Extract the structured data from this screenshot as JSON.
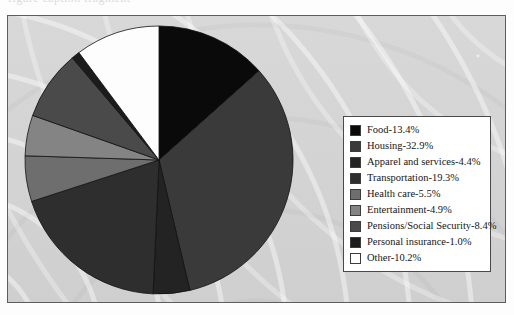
{
  "scan": {
    "top_cropped_text": "figure caption fragment",
    "panel_bg_color": "#d6d6d6",
    "panel_border_color": "#5d5d5d",
    "page_bg_color": "#fdfdfd"
  },
  "legend": {
    "background_color": "#ffffff",
    "border_color": "#4a4a4a",
    "items": [
      {
        "label": "Food-13.4%",
        "color": "#0a0a0a"
      },
      {
        "label": "Housing-32.9%",
        "color": "#3a3a3a"
      },
      {
        "label": "Apparel and services-4.4%",
        "color": "#232323"
      },
      {
        "label": "Transportation-19.3%",
        "color": "#2e2e2e"
      },
      {
        "label": "Health care-5.5%",
        "color": "#6e6e6e"
      },
      {
        "label": "Entertainment-4.9%",
        "color": "#848484"
      },
      {
        "label": "Pensions/Social Security-8.4%",
        "color": "#4a4a4a"
      },
      {
        "label": "Personal insurance-1.0%",
        "color": "#1c1c1c"
      },
      {
        "label": "Other-10.2%",
        "color": "#fdfdfd"
      }
    ]
  },
  "chart_data": {
    "type": "pie",
    "title": "",
    "xlabel": "",
    "ylabel": "",
    "legend_position": "right",
    "grid": false,
    "start_angle_deg": 0,
    "direction": "clockwise",
    "units": "percent",
    "total": 100.0,
    "categories": [
      "Food",
      "Housing",
      "Apparel and services",
      "Transportation",
      "Health care",
      "Entertainment",
      "Pensions/Social Security",
      "Personal insurance",
      "Other"
    ],
    "values": [
      13.4,
      32.9,
      4.4,
      19.3,
      5.5,
      4.9,
      8.4,
      1.0,
      10.2
    ],
    "colors": [
      "#0a0a0a",
      "#3a3a3a",
      "#232323",
      "#2e2e2e",
      "#6e6e6e",
      "#848484",
      "#4a4a4a",
      "#1c1c1c",
      "#fdfdfd"
    ],
    "slice_labels": [
      "Food-13.4%",
      "Housing-32.9%",
      "Apparel and services-4.4%",
      "Transportation-19.3%",
      "Health care-5.5%",
      "Entertainment-4.9%",
      "Pensions/Social Security-8.4%",
      "Personal insurance-1.0%",
      "Other-10.2%"
    ],
    "geometry": {
      "cx": 136,
      "cy": 136,
      "r": 134,
      "stroke": "#111111",
      "stroke_width": 0.8
    }
  }
}
